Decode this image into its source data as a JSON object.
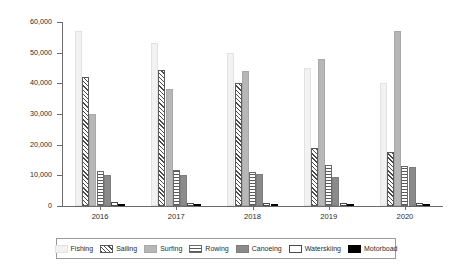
{
  "chart_data": {
    "type": "bar",
    "title": "",
    "xlabel": "",
    "ylabel": "Number licenses",
    "ylim": [
      0,
      60000
    ],
    "yticks": [
      "0",
      "10,000",
      "20,000",
      "30,000",
      "40,000",
      "50,000",
      "60,000"
    ],
    "grid": false,
    "legend_position": "bottom",
    "categories": [
      "2016",
      "2017",
      "2018",
      "2019",
      "2020"
    ],
    "series": [
      {
        "name": "Fishing",
        "color": "#f2f2f2",
        "pattern": "solid",
        "values": [
          57000,
          53000,
          50000,
          45000,
          40000
        ]
      },
      {
        "name": "Sailing",
        "color": "#4a4a4a",
        "pattern": "diagonal-hatch",
        "values": [
          42000,
          44500,
          40000,
          19000,
          17500
        ]
      },
      {
        "name": "Surfing",
        "color": "#b7b7b7",
        "pattern": "solid",
        "values": [
          30000,
          38000,
          44000,
          48000,
          57000
        ]
      },
      {
        "name": "Rowing",
        "color": "#5a5a5a",
        "pattern": "horizontal-lines",
        "values": [
          11500,
          11800,
          11000,
          13500,
          13000
        ]
      },
      {
        "name": "Canoeing",
        "color": "#8a8a8a",
        "pattern": "solid",
        "values": [
          10000,
          10000,
          10300,
          9500,
          12800
        ]
      },
      {
        "name": "Waterskiing",
        "color": "#ffffff",
        "pattern": "outline",
        "values": [
          1200,
          1100,
          1000,
          1000,
          900
        ]
      },
      {
        "name": "Motorboad",
        "color": "#000000",
        "pattern": "solid",
        "values": [
          600,
          550,
          550,
          500,
          500
        ]
      }
    ]
  },
  "legend": {
    "items": [
      {
        "label": "Fishing"
      },
      {
        "label": "Sailing"
      },
      {
        "label": "Surfing"
      },
      {
        "label": "Rowing"
      },
      {
        "label": "Canoeing"
      },
      {
        "label": "Waterskiing"
      },
      {
        "label": "Motorboad"
      }
    ]
  }
}
